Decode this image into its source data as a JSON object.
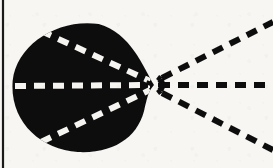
{
  "figure": {
    "caption": "",
    "canvas": {
      "width": 273,
      "height": 168
    },
    "colors": {
      "background": "#f7f6f3",
      "ink": "#0d0d0d",
      "blob_fill": "#111111",
      "inner_dash": "#f5f4f1",
      "border_rule": "#1a1a1a"
    },
    "border_rule": {
      "present": true,
      "orientation": "vertical",
      "x": 3,
      "y_top": 0,
      "y_bottom": 168,
      "thickness": 2.2
    },
    "vertex": {
      "x": 154,
      "y": 85,
      "label": "apex"
    },
    "blob": {
      "name": "main-lobe",
      "fill": "#111111",
      "center": {
        "x": 82,
        "y": 87
      },
      "radius_x": 70,
      "radius_y": 65,
      "description": "solid black rounded lobe, teardrop toward apex on the right"
    },
    "rays": [
      {
        "id": "ray-axis",
        "label": "boresight axis",
        "angle_deg": 0,
        "segment_inside": {
          "x1": 15,
          "y1": 86,
          "x2": 150,
          "y2": 85
        },
        "segment_outside": {
          "x1": 159,
          "y1": 85,
          "x2": 273,
          "y2": 85
        },
        "dash_inside_color": "#f5f4f1",
        "dash_outside_color": "#0d0d0d"
      },
      {
        "id": "ray-upper",
        "label": "upper sidelobe edge",
        "angle_deg": 28,
        "segment_inside": {
          "x1": 41,
          "y1": 31,
          "x2": 150,
          "y2": 81
        },
        "segment_outside": {
          "x1": 162,
          "y1": 78,
          "x2": 273,
          "y2": 22
        },
        "dash_inside_color": "#f5f4f1",
        "dash_outside_color": "#0d0d0d"
      },
      {
        "id": "ray-lower",
        "label": "lower sidelobe edge",
        "angle_deg": -28,
        "segment_inside": {
          "x1": 41,
          "y1": 142,
          "x2": 150,
          "y2": 90
        },
        "segment_outside": {
          "x1": 162,
          "y1": 93,
          "x2": 273,
          "y2": 150
        },
        "dash_inside_color": "#f5f4f1",
        "dash_outside_color": "#0d0d0d"
      }
    ],
    "dash_style": {
      "inside_dash": 11,
      "inside_gap": 8,
      "inside_width": 6,
      "outside_dash": 11,
      "outside_gap": 8,
      "outside_width": 6
    }
  }
}
